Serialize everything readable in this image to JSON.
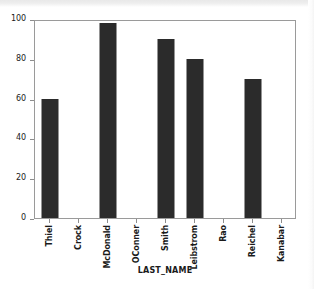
{
  "chart_data": {
    "type": "bar",
    "title": "",
    "subtitle": "",
    "xlabel": "LAST_NAME",
    "ylabel": "",
    "categories": [
      "Thiel",
      "Crock",
      "McDonald",
      "OConner",
      "Smith",
      "Leibstrom",
      "Rao",
      "Reichel",
      "Kanabar"
    ],
    "values": [
      60,
      0,
      98,
      0,
      90,
      80,
      0,
      70,
      0
    ],
    "ylim": [
      0,
      100
    ],
    "yticks": [
      0,
      20,
      40,
      60,
      80,
      100
    ],
    "ytick_labels": [
      "0",
      "20",
      "40",
      "60",
      "80",
      "100"
    ],
    "grid": false,
    "legend": "none",
    "bar_color": "#2b2b2b",
    "plot_background": "#ffffff",
    "axis_color": "#9a9a9a"
  }
}
